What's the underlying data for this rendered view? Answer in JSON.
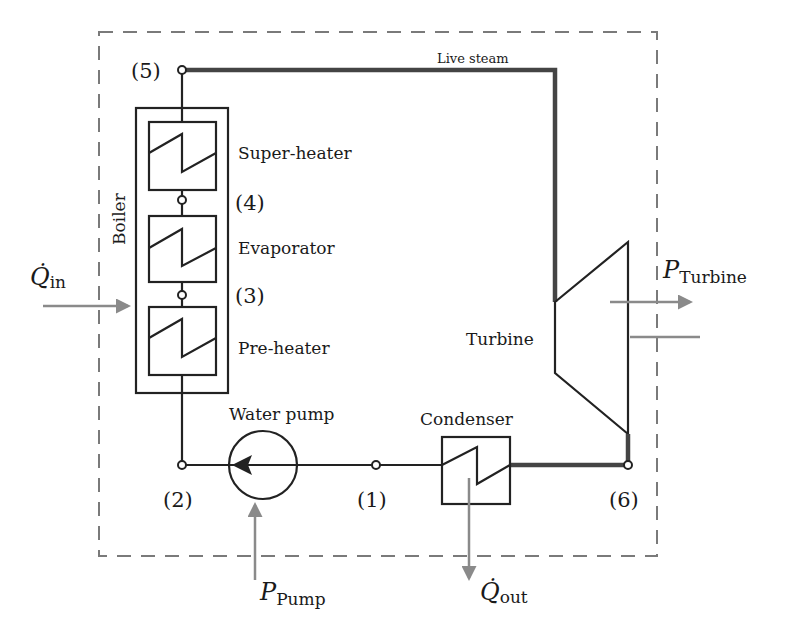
{
  "diagram": {
    "type": "rankine-cycle-schematic",
    "colors": {
      "line": "#222222",
      "live_steam_line": "#444444",
      "energy_arrow": "#8a8a8a",
      "system_boundary": "#7a7a7a"
    },
    "components": {
      "boiler": {
        "label": "Boiler"
      },
      "super_heater": {
        "label": "Super-heater"
      },
      "evaporator": {
        "label": "Evaporator"
      },
      "pre_heater": {
        "label": "Pre-heater"
      },
      "water_pump": {
        "label": "Water pump"
      },
      "condenser": {
        "label": "Condenser"
      },
      "turbine": {
        "label": "Turbine"
      }
    },
    "pipe_labels": {
      "live_steam": "Live steam"
    },
    "nodes": {
      "n1": "(1)",
      "n2": "(2)",
      "n3": "(3)",
      "n4": "(4)",
      "n5": "(5)",
      "n6": "(6)"
    },
    "energy_flows": {
      "q_in": {
        "symbol": "Q̇",
        "subscript": "in"
      },
      "q_out": {
        "symbol": "Q̇",
        "subscript": "out"
      },
      "p_pump": {
        "symbol": "P",
        "subscript": "Pump"
      },
      "p_turbine": {
        "symbol": "P",
        "subscript": "Turbine"
      }
    }
  }
}
